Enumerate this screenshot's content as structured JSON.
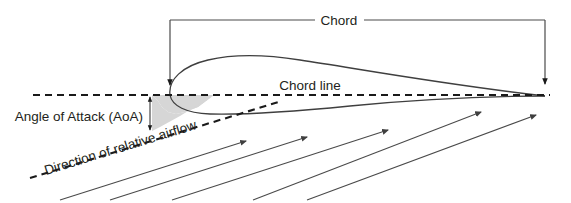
{
  "diagram": {
    "labels": {
      "chord": "Chord",
      "chord_line": "Chord line",
      "angle_of_attack": "Angle of Attack (AoA)",
      "airflow_direction": "Direction of relative airflow"
    },
    "colors": {
      "background": "#ffffff",
      "outline": "#3f3f3f",
      "dashed_line": "#1a1a1a",
      "shaded_wedge": "#d6d6d6",
      "text": "#231f20",
      "thin_line": "#4a4a4a"
    },
    "geometry": {
      "chord_line_y": 95,
      "chord_line_x_start": 33,
      "chord_line_x_end": 550,
      "leading_edge_x": 170,
      "trailing_edge_x": 545,
      "airfoil_peak_x": 285,
      "airfoil_peak_y": 58,
      "airflow_angle_degrees": -17
    },
    "airflow_arrows": [
      {
        "x1": 60,
        "y1": 200,
        "x2": 246,
        "y2": 141
      },
      {
        "x1": 110,
        "y1": 200,
        "x2": 307,
        "y2": 137
      },
      {
        "x1": 172,
        "y1": 200,
        "x2": 388,
        "y2": 130
      },
      {
        "x1": 253,
        "y1": 200,
        "x2": 481,
        "y2": 112
      },
      {
        "x1": 307,
        "y1": 200,
        "x2": 536,
        "y2": 115
      }
    ]
  }
}
